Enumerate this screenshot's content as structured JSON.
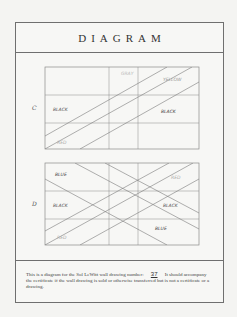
{
  "title": "DIAGRAM",
  "colors": {
    "paper": "#f4f4f2",
    "frame": "#6f6f6f",
    "grid": "#8a8a8a",
    "line": "#7a7a7a",
    "text": "#444444"
  },
  "diagrams": [
    {
      "label": "C",
      "box": {
        "x": 29,
        "y": 14,
        "w": 154,
        "h": 82
      },
      "grid_x": [
        64,
        93
      ],
      "grid_y": [
        28,
        56
      ],
      "lines": [
        [
          0,
          69,
          122,
          0
        ],
        [
          0,
          82,
          147,
          0
        ],
        [
          35,
          82,
          154,
          15
        ]
      ],
      "annotations": [
        {
          "text": "BLACK",
          "x": 8,
          "y": 44,
          "color": "#555"
        },
        {
          "text": "BLACK",
          "x": 116,
          "y": 46,
          "color": "#444"
        },
        {
          "text": "YELLOW",
          "x": 118,
          "y": 14,
          "color": "#999"
        },
        {
          "text": "RED",
          "x": 12,
          "y": 77,
          "color": "#aaa"
        },
        {
          "text": "GRAY",
          "x": 76,
          "y": 8,
          "color": "#bbb"
        }
      ]
    },
    {
      "label": "D",
      "box": {
        "x": 29,
        "y": 110,
        "w": 154,
        "h": 82
      },
      "grid_x": [
        64,
        93
      ],
      "grid_y": [
        28,
        56
      ],
      "lines": [
        [
          0,
          68,
          124,
          0
        ],
        [
          0,
          82,
          148,
          0
        ],
        [
          35,
          82,
          154,
          16
        ],
        [
          30,
          0,
          154,
          66
        ],
        [
          0,
          16,
          122,
          82
        ],
        [
          60,
          0,
          154,
          50
        ]
      ],
      "annotations": [
        {
          "text": "BLUE",
          "x": 10,
          "y": 13,
          "color": "#444"
        },
        {
          "text": "BLACK",
          "x": 8,
          "y": 44,
          "color": "#555"
        },
        {
          "text": "BLACK",
          "x": 118,
          "y": 44,
          "color": "#555"
        },
        {
          "text": "BLUE",
          "x": 110,
          "y": 67,
          "color": "#444"
        },
        {
          "text": "RED",
          "x": 126,
          "y": 16,
          "color": "#aaa"
        },
        {
          "text": "RED",
          "x": 12,
          "y": 76,
          "color": "#aaa"
        }
      ]
    }
  ],
  "caption": {
    "line1_pre": "This is a diagram for the Sol LeWitt wall drawing number:",
    "number": "37",
    "line1_post": "It should",
    "rest": "accompany the certificate if the wall drawing is sold or otherwise transferred but is not a certificate or a drawing."
  }
}
